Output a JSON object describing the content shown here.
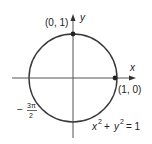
{
  "diagram": {
    "equation": {
      "x": "x",
      "exp1": "2",
      "plus": "+",
      "y": "y",
      "exp2": "2",
      "equals": "= 1"
    },
    "axes": {
      "x_label": "x",
      "y_label": "y"
    },
    "points": [
      {
        "label": "(0, 1)"
      },
      {
        "label": "(1, 0)"
      }
    ],
    "angle_label": {
      "sign": "−",
      "numerator": "3π",
      "denominator": "2"
    },
    "colors": {
      "circle": "#3a3a3a",
      "axis": "#555555",
      "point": "#222222",
      "text": "#222222"
    }
  }
}
